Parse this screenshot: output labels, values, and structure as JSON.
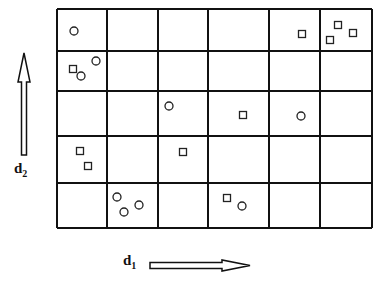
{
  "grid": {
    "columns": 6,
    "rows": 5,
    "col_lines_x": [
      57,
      107,
      158,
      208,
      269,
      320,
      372
    ],
    "row_lines_y": [
      9,
      51,
      91,
      136,
      183,
      228
    ],
    "line_color": "#111111"
  },
  "markers": [
    {
      "shape": "circle",
      "x": 74,
      "y": 31,
      "row": 0,
      "col": 0
    },
    {
      "shape": "square",
      "x": 302,
      "y": 34,
      "row": 0,
      "col": 4
    },
    {
      "shape": "square",
      "x": 338,
      "y": 25,
      "row": 0,
      "col": 5
    },
    {
      "shape": "square",
      "x": 353,
      "y": 33,
      "row": 0,
      "col": 5
    },
    {
      "shape": "square",
      "x": 330,
      "y": 40,
      "row": 0,
      "col": 5
    },
    {
      "shape": "square",
      "x": 73,
      "y": 69,
      "row": 1,
      "col": 0
    },
    {
      "shape": "circle",
      "x": 81,
      "y": 76,
      "row": 1,
      "col": 0
    },
    {
      "shape": "circle",
      "x": 96,
      "y": 61,
      "row": 1,
      "col": 0
    },
    {
      "shape": "circle",
      "x": 169,
      "y": 106,
      "row": 2,
      "col": 2
    },
    {
      "shape": "square",
      "x": 243,
      "y": 115,
      "row": 2,
      "col": 3
    },
    {
      "shape": "circle",
      "x": 301,
      "y": 116,
      "row": 2,
      "col": 4
    },
    {
      "shape": "square",
      "x": 80,
      "y": 151,
      "row": 3,
      "col": 0
    },
    {
      "shape": "square",
      "x": 88,
      "y": 166,
      "row": 3,
      "col": 0
    },
    {
      "shape": "square",
      "x": 183,
      "y": 152,
      "row": 3,
      "col": 2
    },
    {
      "shape": "circle",
      "x": 117,
      "y": 197,
      "row": 4,
      "col": 1
    },
    {
      "shape": "circle",
      "x": 124,
      "y": 212,
      "row": 4,
      "col": 1
    },
    {
      "shape": "circle",
      "x": 139,
      "y": 205,
      "row": 4,
      "col": 1
    },
    {
      "shape": "square",
      "x": 227,
      "y": 198,
      "row": 4,
      "col": 3
    },
    {
      "shape": "circle",
      "x": 242,
      "y": 206,
      "row": 4,
      "col": 3
    }
  ],
  "axes": {
    "horizontal": {
      "label_main": "d",
      "label_sub": "1",
      "direction": "right"
    },
    "vertical": {
      "label_main": "d",
      "label_sub": "2",
      "direction": "up"
    }
  }
}
